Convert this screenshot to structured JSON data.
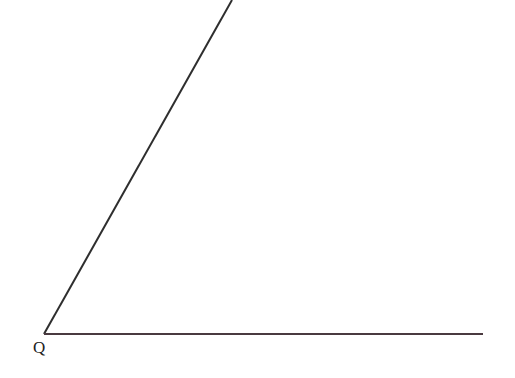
{
  "diagram": {
    "type": "angle",
    "vertex": {
      "label": "Q",
      "x": 44,
      "y": 334
    },
    "rays": [
      {
        "name": "upper-ray",
        "from": [
          44,
          334
        ],
        "to": [
          232,
          0
        ],
        "color": "#2e2e2e"
      },
      {
        "name": "horizontal-ray",
        "from": [
          44,
          334
        ],
        "to": [
          483,
          334
        ],
        "color": "#4a3a40"
      }
    ]
  }
}
